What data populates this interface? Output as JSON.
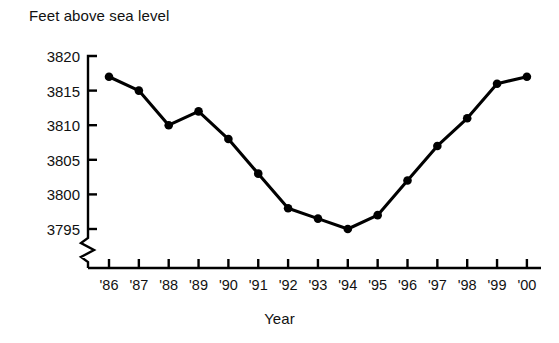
{
  "chart_data": {
    "type": "line",
    "title": "",
    "ylabel": "Feet above sea level",
    "xlabel": "Year",
    "categories": [
      "'86",
      "'87",
      "'88",
      "'89",
      "'90",
      "'91",
      "'92",
      "'93",
      "'94",
      "'95",
      "'96",
      "'97",
      "'98",
      "'99",
      "'00"
    ],
    "values": [
      3817,
      3815,
      3810,
      3812,
      3808,
      3803,
      3798,
      3796.5,
      3795,
      3797,
      3802,
      3807,
      3811,
      3816,
      3817
    ],
    "series": [
      {
        "name": "Feet above sea level",
        "values": [
          3817,
          3815,
          3810,
          3812,
          3808,
          3803,
          3798,
          3796.5,
          3795,
          3797,
          3802,
          3807,
          3811,
          3816,
          3817
        ]
      }
    ],
    "y_ticks": [
      3795,
      3800,
      3805,
      3810,
      3815,
      3820
    ],
    "y_tick_labels": [
      "3795",
      "3800",
      "3805",
      "3810",
      "3815",
      "3820"
    ],
    "ylim": [
      3795,
      3820
    ],
    "xlim": [
      "'86",
      "'00"
    ],
    "axis_break": true,
    "axis_break_note": "zigzag break on y-axis below 3795",
    "grid": false,
    "legend": "none",
    "marker": "filled-circle",
    "line_color": "#000000",
    "marker_color": "#000000",
    "background_color": "#ffffff"
  },
  "labels": {
    "y_axis_title": "Feet above sea level",
    "x_axis_title": "Year"
  }
}
